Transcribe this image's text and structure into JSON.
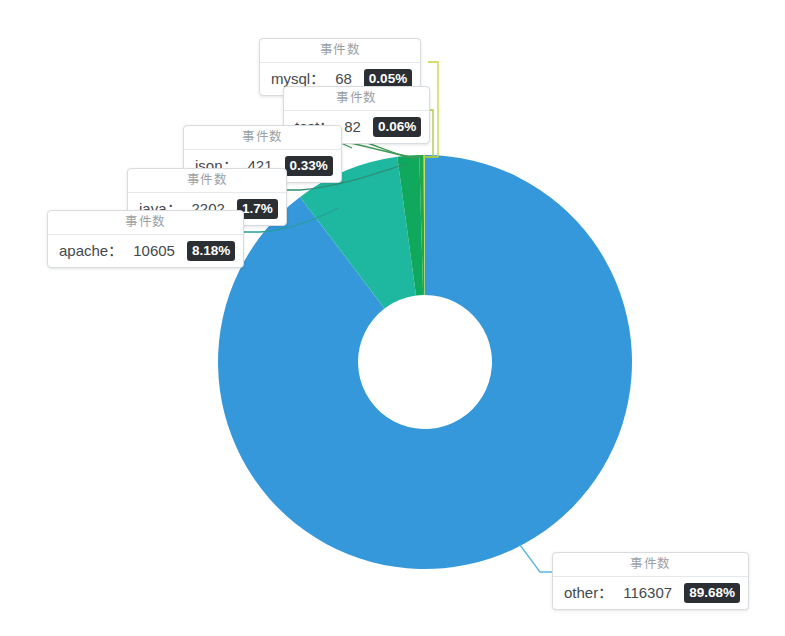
{
  "chart_data": {
    "type": "pie",
    "variant": "donut",
    "title": "",
    "series_label": "事件数",
    "total": 129685,
    "categories": [
      "other",
      "apache",
      "java",
      "json",
      "test",
      "mysql"
    ],
    "values": [
      116307,
      10605,
      2202,
      421,
      82,
      68
    ],
    "percents": [
      "89.68%",
      "8.18%",
      "1.7%",
      "0.33%",
      "0.06%",
      "0.05%"
    ],
    "colors": [
      "#3498db",
      "#1eb8a0",
      "#10a85c",
      "#1fa84a",
      "#7fc241",
      "#c8d43a"
    ],
    "legend_position": "none",
    "grid": false,
    "slices": [
      {
        "label": "other",
        "value": "116307",
        "percent": "89.68%",
        "color": "#3498db"
      },
      {
        "label": "apache",
        "value": "10605",
        "percent": "8.18%",
        "color": "#1eb8a0"
      },
      {
        "label": "java",
        "value": "2202",
        "percent": "1.7%",
        "color": "#10a85c"
      },
      {
        "label": "json",
        "value": "421",
        "percent": "0.33%",
        "color": "#1fa84a"
      },
      {
        "label": "test",
        "value": "82",
        "percent": "0.06%",
        "color": "#7fc241"
      },
      {
        "label": "mysql",
        "value": "68",
        "percent": "0.05%",
        "color": "#c8d43a"
      }
    ]
  },
  "tooltips": {
    "header": "事件数",
    "separator": "：",
    "mysql": {
      "header": "事件数",
      "key": "mysql",
      "sep": "：",
      "value": "68",
      "percent": "0.05%"
    },
    "test": {
      "header": "事件数",
      "key": "test",
      "sep": "：",
      "value": "82",
      "percent": "0.06%"
    },
    "json": {
      "header": "事件数",
      "key": "json",
      "sep": "：",
      "value": "421",
      "percent": "0.33%"
    },
    "java": {
      "header": "事件数",
      "key": "java",
      "sep": "：",
      "value": "2202",
      "percent": "1.7%"
    },
    "apache": {
      "header": "事件数",
      "key": "apache",
      "sep": "：",
      "value": "10605",
      "percent": "8.18%"
    },
    "other": {
      "header": "事件数",
      "key": "other",
      "sep": "：",
      "value": "116307",
      "percent": "89.68%"
    }
  },
  "colors": {
    "background": "#ffffff",
    "blue": "#3498db",
    "teal": "#1eb8a0",
    "green": "#10a85c",
    "green2": "#1fa84a",
    "lime": "#7fc241",
    "yellow_green": "#c8d43a",
    "badge_bg": "#2b2f33",
    "badge_text": "#ffffff",
    "tooltip_border": "#d8dcdf",
    "tooltip_header_text": "#9aa0a6",
    "tooltip_body_text": "#44494d"
  }
}
